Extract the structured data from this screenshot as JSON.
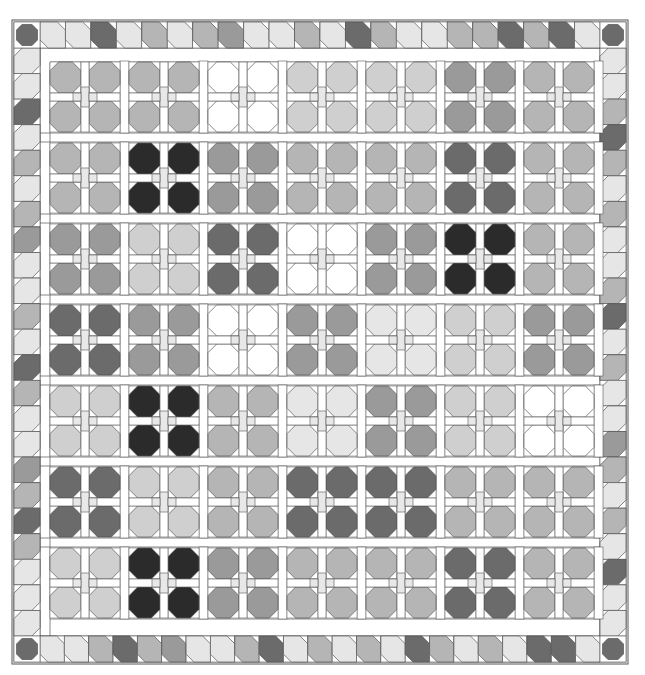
{
  "caption": "quilt diagram",
  "palette": {
    "white": "#ffffff",
    "xlight": "#e6e6e6",
    "light": "#cfcfcf",
    "mid": "#b5b5b5",
    "midDark": "#9a9a9a",
    "dark": "#6b6b6b",
    "black": "#2b2b2b",
    "line": "#555555",
    "sash": "#ffffff",
    "center": "#e8e8e8"
  },
  "frame": {
    "x": 14,
    "y": 22,
    "w": 612,
    "h": 640,
    "borderCell": 26
  },
  "field": {
    "x": 40,
    "y": 48,
    "w": 560,
    "h": 588
  },
  "grid": {
    "colX": [
      50,
      129,
      208,
      287,
      366,
      445,
      524
    ],
    "rowY": [
      62,
      143,
      224,
      305,
      386,
      467,
      548
    ],
    "blockW": 70,
    "blockH": 70
  },
  "blocks": [
    [
      "mid",
      "mid",
      "white",
      "light",
      "light",
      "midDark",
      "mid"
    ],
    [
      "mid",
      "black",
      "midDark",
      "mid",
      "mid",
      "dark",
      "mid"
    ],
    [
      "midDark",
      "light",
      "dark",
      "white",
      "midDark",
      "black",
      "mid"
    ],
    [
      "dark",
      "midDark",
      "white",
      "midDark",
      "xlight",
      "light",
      "midDark"
    ],
    [
      "light",
      "black",
      "mid",
      "xlight",
      "midDark",
      "light",
      "white"
    ],
    [
      "dark",
      "light",
      "mid",
      "dark",
      "dark",
      "mid",
      "mid"
    ],
    [
      "light",
      "black",
      "midDark",
      "mid",
      "mid",
      "dark",
      "mid"
    ]
  ],
  "border": {
    "top": [
      "xlight",
      "xlight",
      "dark",
      "xlight",
      "mid",
      "xlight",
      "mid",
      "midDark",
      "xlight",
      "xlight",
      "mid",
      "xlight",
      "dark",
      "mid",
      "xlight",
      "xlight",
      "mid",
      "mid",
      "dark",
      "mid",
      "dark",
      "xlight"
    ],
    "bottom": [
      "xlight",
      "xlight",
      "mid",
      "dark",
      "mid",
      "midDark",
      "xlight",
      "xlight",
      "mid",
      "dark",
      "xlight",
      "mid",
      "xlight",
      "mid",
      "xlight",
      "dark",
      "mid",
      "xlight",
      "mid",
      "xlight",
      "dark",
      "dark",
      "xlight"
    ],
    "left": [
      "xlight",
      "xlight",
      "dark",
      "xlight",
      "mid",
      "xlight",
      "mid",
      "midDark",
      "xlight",
      "xlight",
      "mid",
      "xlight",
      "dark",
      "mid",
      "xlight",
      "xlight",
      "midDark",
      "mid",
      "dark",
      "mid",
      "xlight",
      "xlight",
      "xlight"
    ],
    "right": [
      "xlight",
      "xlight",
      "mid",
      "dark",
      "mid",
      "xlight",
      "mid",
      "xlight",
      "xlight",
      "mid",
      "dark",
      "xlight",
      "mid",
      "xlight",
      "xlight",
      "midDark",
      "mid",
      "xlight",
      "mid",
      "xlight",
      "dark",
      "xlight",
      "xlight"
    ],
    "corners": "dark"
  }
}
